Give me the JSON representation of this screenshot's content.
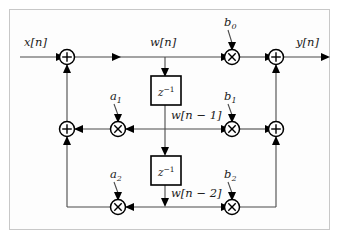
{
  "figure": {
    "name": "Direct Form II second-order IIR filter signal flow graph",
    "background_color": "#ffffff",
    "border_color": "#c8c8c8",
    "wire_color": "#4a4a4a",
    "node_color": "#000000"
  },
  "signals": {
    "input": "x[n]",
    "output": "y[n]",
    "state": "w[n]",
    "state_d1": "w[n − 1]",
    "state_d2": "w[n − 2]"
  },
  "blocks": [
    {
      "id": "delay1",
      "label_base": "z",
      "label_exp": "−1",
      "name": "unit-delay-block-1"
    },
    {
      "id": "delay2",
      "label_base": "z",
      "label_exp": "−1",
      "name": "unit-delay-block-2"
    }
  ],
  "coefficients": {
    "feedforward": [
      {
        "id": "b0",
        "base": "b",
        "sub": "0"
      },
      {
        "id": "b1",
        "base": "b",
        "sub": "1"
      },
      {
        "id": "b2",
        "base": "b",
        "sub": "2"
      }
    ],
    "feedback": [
      {
        "id": "a1",
        "base": "a",
        "sub": "1"
      },
      {
        "id": "a2",
        "base": "a",
        "sub": "2"
      }
    ]
  },
  "operators": {
    "adder_glyph": "plus",
    "multiplier_glyph": "times",
    "adders": [
      {
        "id": "sum-in",
        "name": "input-adder"
      },
      {
        "id": "sum-fb1",
        "name": "feedback-adder-1"
      },
      {
        "id": "sum-out",
        "name": "output-adder"
      },
      {
        "id": "sum-ff1",
        "name": "feedforward-adder-1"
      }
    ],
    "multipliers": [
      {
        "id": "mul-b0",
        "name": "multiplier-b0"
      },
      {
        "id": "mul-b1",
        "name": "multiplier-b1"
      },
      {
        "id": "mul-b2",
        "name": "multiplier-b2"
      },
      {
        "id": "mul-a1",
        "name": "multiplier-a1"
      },
      {
        "id": "mul-a2",
        "name": "multiplier-a2"
      }
    ]
  }
}
